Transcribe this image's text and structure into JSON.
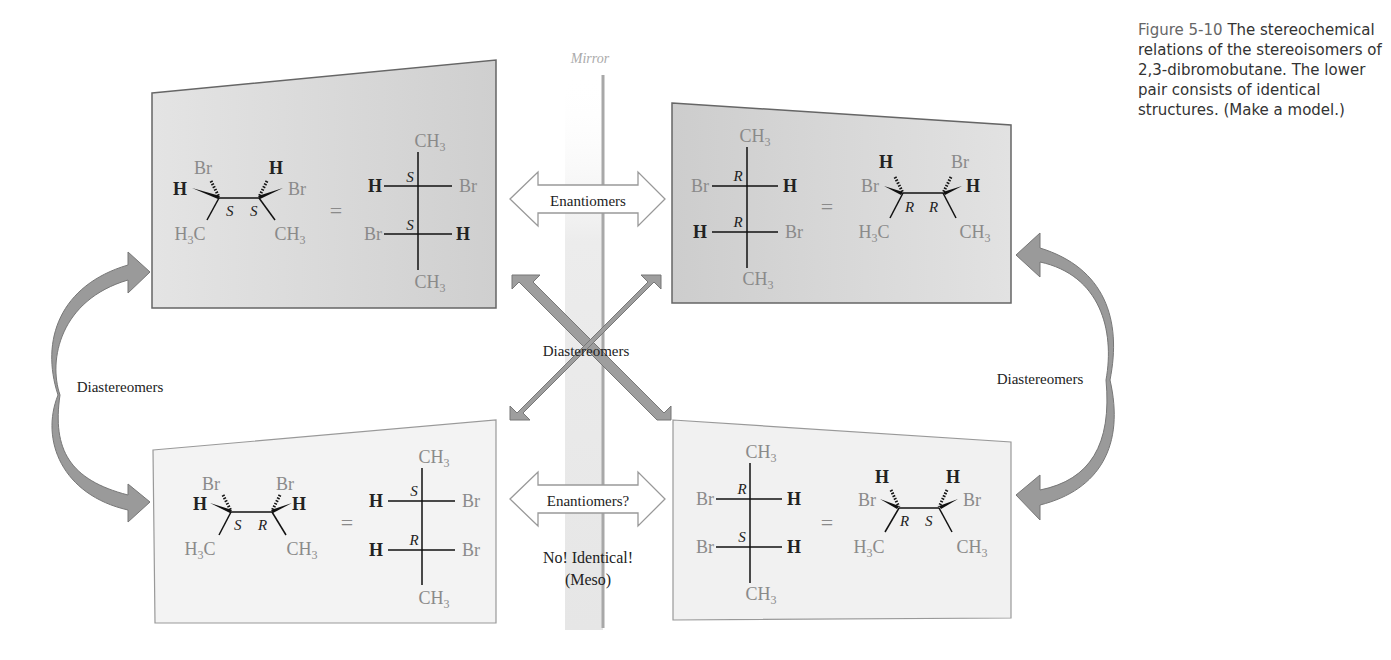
{
  "caption": {
    "figure_number": "Figure 5-10",
    "text": "The stereochemical relations of the stereoisomers of 2,3-dibromobutane. The lower pair consists of identical structures. (Make a model.)"
  },
  "mirror_label": "Mirror",
  "relations": {
    "top_horizontal": "Enantiomers",
    "bottom_horizontal": "Enantiomers?",
    "bottom_note_line1": "No! Identical!",
    "bottom_note_line2": "(Meso)",
    "cross": "Diastereomers",
    "left_vertical": "Diastereomers",
    "right_vertical": "Diastereomers"
  },
  "panels": {
    "top_left": {
      "config": [
        "S",
        "S"
      ],
      "wedge": {
        "c1_up": "Br",
        "c1_left": "H",
        "c2_up": "H",
        "c2_right": "Br",
        "c1_label": "S",
        "c2_label": "S",
        "c1_down": "H3C",
        "c2_down": "CH3"
      },
      "fischer": {
        "top": "CH3",
        "bottom": "CH3",
        "row1_left": "H",
        "row1_right": "Br",
        "row1_label": "S",
        "row2_left": "Br",
        "row2_right": "H",
        "row2_label": "S"
      },
      "equals": "="
    },
    "top_right": {
      "config": [
        "R",
        "R"
      ],
      "fischer": {
        "top": "CH3",
        "bottom": "CH3",
        "row1_left": "Br",
        "row1_right": "H",
        "row1_label": "R",
        "row2_left": "H",
        "row2_right": "Br",
        "row2_label": "R"
      },
      "wedge": {
        "c1_up": "H",
        "c1_left": "Br",
        "c2_up": "Br",
        "c2_right": "H",
        "c1_label": "R",
        "c2_label": "R",
        "c1_down": "H3C",
        "c2_down": "CH3"
      },
      "equals": "="
    },
    "bottom_left": {
      "config": [
        "S",
        "R"
      ],
      "wedge": {
        "c1_up": "Br",
        "c1_left": "H",
        "c2_up": "Br",
        "c2_right": "H",
        "c1_label": "S",
        "c2_label": "R",
        "c1_down": "H3C",
        "c2_down": "CH3"
      },
      "fischer": {
        "top": "CH3",
        "bottom": "CH3",
        "row1_left": "H",
        "row1_right": "Br",
        "row1_label": "S",
        "row2_left": "H",
        "row2_right": "Br",
        "row2_label": "R"
      },
      "equals": "="
    },
    "bottom_right": {
      "config": [
        "R",
        "S"
      ],
      "fischer": {
        "top": "CH3",
        "bottom": "CH3",
        "row1_left": "Br",
        "row1_right": "H",
        "row1_label": "R",
        "row2_left": "Br",
        "row2_right": "H",
        "row2_label": "S"
      },
      "wedge": {
        "c1_up": "H",
        "c1_left": "Br",
        "c2_up": "H",
        "c2_right": "Br",
        "c1_label": "R",
        "c2_label": "S",
        "c1_down": "H3C",
        "c2_down": "CH3"
      },
      "equals": "="
    }
  },
  "colors": {
    "arrow_fill": "#9a9a9a",
    "top_panel_fill": "#d4d4d4",
    "bottom_panel_fill": "#f2f2f2",
    "mirror_line": "#a8a8a8"
  }
}
